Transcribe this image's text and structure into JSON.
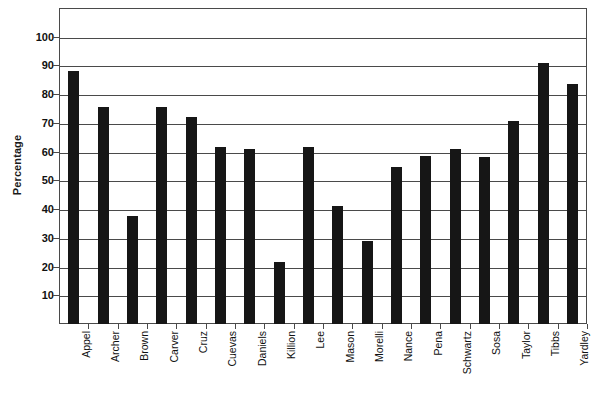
{
  "chart_data": {
    "type": "bar",
    "title": "",
    "xlabel": "",
    "ylabel": "Percentage",
    "ylim": [
      0,
      110
    ],
    "yticks": [
      10,
      20,
      30,
      40,
      50,
      60,
      70,
      80,
      90,
      100
    ],
    "grid": true,
    "legend": "none",
    "bar_color": "#161616",
    "categories": [
      "Appel",
      "Archer",
      "Brown",
      "Carver",
      "Cruz",
      "Cuevas",
      "Daniels",
      "Killion",
      "Lee",
      "Mason",
      "Morelli",
      "Nance",
      "Pena",
      "Schwartz",
      "Sosa",
      "Taylor",
      "Tibbs",
      "Yardley"
    ],
    "values": [
      88,
      75.5,
      37.5,
      75.5,
      72,
      61.5,
      61,
      21.5,
      61.5,
      41,
      29,
      54.5,
      58.5,
      61,
      58,
      70.5,
      91,
      83.5
    ]
  },
  "axes": {
    "y_title": "Percentage"
  }
}
